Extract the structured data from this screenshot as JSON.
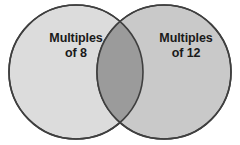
{
  "figure": {
    "type": "venn-diagram",
    "background_color": "#ffffff",
    "sets": [
      {
        "id": "left",
        "name": "multiples-of-8",
        "label_line1": "Multiples",
        "label_line2": "of 8",
        "fill_color": "#dcdcdc",
        "stroke_color": "#3f3f3f",
        "center_x": 76,
        "center_y": 72,
        "radius": 67
      },
      {
        "id": "right",
        "name": "multiples-of-12",
        "label_line1": "Multiples",
        "label_line2": "of 12",
        "fill_color": "#c9c9c9",
        "stroke_color": "#3f3f3f",
        "center_x": 164,
        "center_y": 72,
        "radius": 67
      }
    ],
    "intersection": {
      "name": "common-multiples",
      "fill_color": "#9b9b9b",
      "label": ""
    },
    "stroke_width": 1.6,
    "text_color": "#1a1a1a"
  }
}
